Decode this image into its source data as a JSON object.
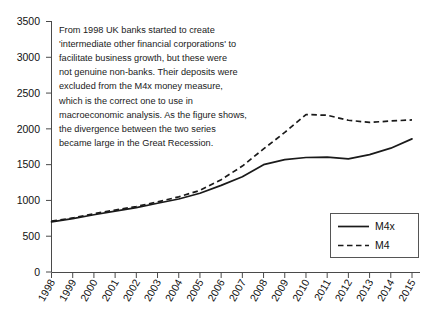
{
  "chart_data": {
    "type": "line",
    "title": "",
    "xlabel": "",
    "ylabel": "",
    "ylim": [
      0,
      3500
    ],
    "ytick_step": 500,
    "grid": false,
    "legend_position": "bottom-right",
    "categories": [
      "1998",
      "1999",
      "2000",
      "2001",
      "2002",
      "2003",
      "2004",
      "2005",
      "2006",
      "2007",
      "2008",
      "2009",
      "2010",
      "2011",
      "2012",
      "2013",
      "2014",
      "2015"
    ],
    "ytick_labels": [
      "0",
      "500",
      "1000",
      "1500",
      "2000",
      "2500",
      "3000",
      "3500"
    ],
    "series": [
      {
        "name": "M4x",
        "style": "solid",
        "values": [
          700,
          745,
          800,
          850,
          900,
          960,
          1020,
          1100,
          1210,
          1330,
          1500,
          1570,
          1600,
          1605,
          1580,
          1640,
          1730,
          1860
        ]
      },
      {
        "name": "M4",
        "style": "dashed",
        "values": [
          710,
          755,
          815,
          865,
          915,
          980,
          1050,
          1140,
          1290,
          1480,
          1720,
          1950,
          2200,
          2190,
          2120,
          2090,
          2110,
          2125
        ]
      }
    ],
    "annotation": {
      "lines": [
        "From 1998 UK banks started to create",
        "'intermediate other financial corporations' to",
        "facilitate  business growth, but these were",
        "not genuine non-banks. Their deposits were",
        "excluded from the M4x money measure,",
        "which is the correct one to use in",
        "macroeconomic analysis. As the figure shows,",
        "the divergence between the two series",
        "became large in the Great Recession."
      ]
    },
    "colors": {
      "series": "#1a1a1a",
      "axis": "#4a4a4a",
      "background": "#ffffff"
    }
  }
}
